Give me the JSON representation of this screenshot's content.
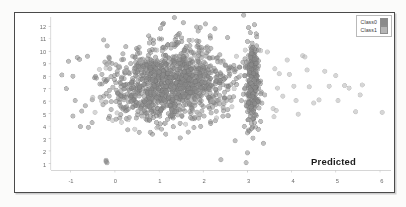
{
  "chart_data": {
    "type": "scatter",
    "title": "",
    "annotation": "Predicted",
    "xlabel": "",
    "ylabel": "",
    "xlim": [
      -1.45,
      6.25
    ],
    "ylim": [
      0.45,
      12.6
    ],
    "xticks": [
      -1,
      0,
      1,
      2,
      3,
      4,
      5,
      6
    ],
    "yticks": [
      1,
      2,
      3,
      4,
      5,
      6,
      7,
      8,
      9,
      10,
      11,
      12
    ],
    "grid": false,
    "legend_position": "top-right",
    "marker": "circle",
    "marker_size": 4.6,
    "marker_opacity": 0.55,
    "series": [
      {
        "name": "Class0",
        "color": "#8a8a8a",
        "edge_color": "#6f6f6f",
        "count": 1450,
        "clusters": [
          {
            "cx": 1.35,
            "cy": 7.6,
            "sx": 0.62,
            "sy": 1.55,
            "n": 1080
          },
          {
            "cx": 3.12,
            "cy": 7.3,
            "sx": 0.085,
            "sy": 1.85,
            "n": 250
          },
          {
            "cx": 0.55,
            "cy": 6.6,
            "sx": 0.45,
            "sy": 1.3,
            "n": 120
          }
        ],
        "outliers": [
          [
            -1.05,
            9.2
          ],
          [
            -1.2,
            8.1
          ],
          [
            -1.1,
            7.0
          ],
          [
            -0.95,
            8.0
          ],
          [
            -0.85,
            9.5
          ],
          [
            -0.8,
            9.35
          ],
          [
            -0.62,
            9.6
          ],
          [
            -0.9,
            6.05
          ],
          [
            -0.95,
            4.8
          ],
          [
            -0.75,
            5.2
          ],
          [
            -0.78,
            3.95
          ],
          [
            -0.6,
            3.9
          ],
          [
            -0.2,
            1.25
          ],
          [
            -0.18,
            1.05
          ],
          [
            -0.2,
            1.15
          ],
          [
            0.85,
            3.35
          ],
          [
            0.8,
            3.5
          ],
          [
            2.4,
            1.3
          ],
          [
            3.0,
            1.85
          ],
          [
            3.0,
            3.45
          ],
          [
            2.05,
            12.2
          ],
          [
            1.85,
            11.95
          ],
          [
            1.55,
            12.3
          ],
          [
            1.1,
            12.25
          ],
          [
            2.55,
            11.1
          ],
          [
            3.2,
            11.4
          ]
        ]
      },
      {
        "name": "Class1",
        "color": "#b5b5b5",
        "edge_color": "#9a9a9a",
        "count": 62,
        "clusters": [],
        "outliers": [
          [
            3.62,
            8.6
          ],
          [
            3.72,
            8.2
          ],
          [
            3.68,
            7.05
          ],
          [
            3.58,
            5.4
          ],
          [
            3.65,
            5.25
          ],
          [
            3.6,
            4.75
          ],
          [
            3.9,
            9.3
          ],
          [
            3.95,
            8.15
          ],
          [
            4.05,
            7.2
          ],
          [
            4.1,
            6.05
          ],
          [
            4.25,
            9.65
          ],
          [
            4.3,
            9.55
          ],
          [
            4.35,
            8.5
          ],
          [
            4.4,
            7.15
          ],
          [
            4.5,
            5.85
          ],
          [
            4.62,
            6.1
          ],
          [
            4.75,
            8.4
          ],
          [
            4.85,
            7.2
          ],
          [
            5.0,
            8.05
          ],
          [
            5.05,
            6.05
          ],
          [
            5.2,
            7.25
          ],
          [
            5.3,
            7.05
          ],
          [
            5.45,
            5.15
          ],
          [
            5.6,
            7.3
          ],
          [
            6.05,
            5.1
          ],
          [
            3.45,
            9.95
          ],
          [
            3.3,
            10.05
          ],
          [
            2.95,
            10.1
          ],
          [
            2.75,
            9.6
          ],
          [
            2.85,
            8.05
          ],
          [
            2.7,
            7.0
          ],
          [
            2.65,
            5.55
          ],
          [
            2.55,
            4.85
          ],
          [
            2.3,
            4.65
          ],
          [
            2.2,
            6.0
          ],
          [
            1.6,
            4.15
          ],
          [
            1.15,
            4.25
          ],
          [
            0.95,
            3.85
          ],
          [
            0.45,
            3.75
          ],
          [
            0.3,
            4.5
          ],
          [
            0.15,
            4.3
          ],
          [
            -0.05,
            4.45
          ],
          [
            0.05,
            5.05
          ],
          [
            -0.3,
            6.0
          ],
          [
            -0.45,
            5.1
          ],
          [
            -0.5,
            6.3
          ],
          [
            -0.35,
            8.55
          ],
          [
            -0.2,
            8.65
          ],
          [
            -0.15,
            9.0
          ],
          [
            0.1,
            8.8
          ],
          [
            0.25,
            8.4
          ],
          [
            0.6,
            9.2
          ],
          [
            0.95,
            10.1
          ],
          [
            1.3,
            10.6
          ],
          [
            1.75,
            10.9
          ],
          [
            2.1,
            10.2
          ],
          [
            2.4,
            9.1
          ],
          [
            1.9,
            4.95
          ],
          [
            2.45,
            5.95
          ],
          [
            3.8,
            6.4
          ],
          [
            4.15,
            4.95
          ],
          [
            5.55,
            6.5
          ]
        ]
      }
    ]
  },
  "legend": {
    "items": [
      {
        "label": "Class0",
        "color": "#8a8a8a"
      },
      {
        "label": "Class1",
        "color": "#b5b5b5"
      }
    ]
  },
  "axis": {
    "x_tick_labels": [
      "-1",
      "0",
      "1",
      "2",
      "3",
      "4",
      "5",
      "6"
    ],
    "y_tick_labels": [
      "1",
      "2",
      "3",
      "4",
      "5",
      "6",
      "7",
      "8",
      "9",
      "10",
      "11",
      "12"
    ]
  }
}
